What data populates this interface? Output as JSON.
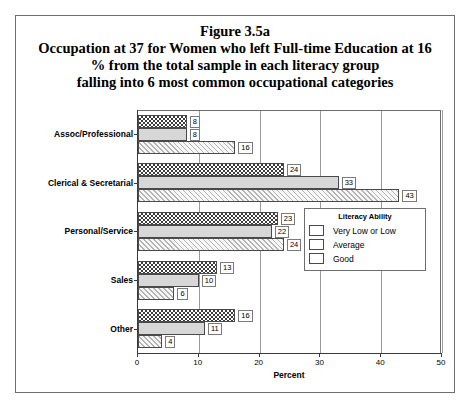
{
  "figure": {
    "title_lines": [
      "Figure 3.5a",
      "Occupation at 37 for Women who left Full-time Education at 16",
      "% from the total sample in each literacy group",
      "falling into 6 most common occupational categories"
    ]
  },
  "legend": {
    "title": "Literacy Ability",
    "entries": [
      {
        "label": "Very Low or Low",
        "pattern": "dark-checkerboard"
      },
      {
        "label": "Average",
        "pattern": "solid-light-gray"
      },
      {
        "label": "Good",
        "pattern": "diagonal-hatch"
      }
    ]
  },
  "chart_data": {
    "type": "bar",
    "orientation": "horizontal",
    "title": "Figure 3.5a\nOccupation at 37 for Women who left Full-time Education at 16\n% from the total sample in each literacy group\nfalling into 6 most common occupational categories",
    "xlabel": "Percent",
    "ylabel": "",
    "xlim": [
      0,
      50
    ],
    "xticks": [
      0,
      10,
      20,
      30,
      40,
      50
    ],
    "xtick_labels": [
      "0",
      "10",
      "20",
      "30",
      "40",
      "50"
    ],
    "grid": true,
    "legend_title": "Literacy Ability",
    "legend_position": "lower-right",
    "categories": [
      "Assoc/Professional",
      "Clerical & Secretarial",
      "Personal/Service",
      "Sales",
      "Other"
    ],
    "series": [
      {
        "name": "Very Low or Low",
        "values": [
          8,
          24,
          23,
          13,
          16
        ]
      },
      {
        "name": "Average",
        "values": [
          8,
          33,
          22,
          10,
          11
        ]
      },
      {
        "name": "Good",
        "values": [
          16,
          43,
          24,
          6,
          4
        ]
      }
    ]
  }
}
